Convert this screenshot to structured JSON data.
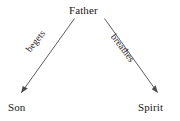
{
  "diagram": {
    "background_color": "#ffffff",
    "line_color": "#4a4a4a",
    "text_color": "#181818",
    "nodes": [
      {
        "id": "father",
        "label": "Father"
      },
      {
        "id": "son",
        "label": "Son"
      },
      {
        "id": "spirit",
        "label": "Spirit"
      }
    ],
    "edges": [
      {
        "id": "father-son",
        "label": "begets",
        "from": "father",
        "to": "son",
        "arrowhead": "filled-triangle",
        "direction": "down-left"
      },
      {
        "id": "father-spirit",
        "label": "breathes",
        "from": "father",
        "to": "spirit",
        "arrowhead": "filled-triangle",
        "direction": "down-right"
      }
    ]
  }
}
